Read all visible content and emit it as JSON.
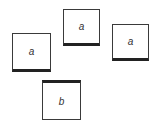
{
  "cards": [
    {
      "label": "a",
      "x": 12,
      "y": 33,
      "w": 39,
      "h": 39,
      "thick_edge": "bottom"
    },
    {
      "label": "a",
      "x": 63,
      "y": 9,
      "w": 37,
      "h": 37,
      "thick_edge": "bottom"
    },
    {
      "label": "a",
      "x": 112,
      "y": 24,
      "w": 37,
      "h": 37,
      "thick_edge": "bottom"
    },
    {
      "label": "b",
      "x": 42,
      "y": 80,
      "w": 39,
      "h": 40,
      "thick_edge": "top"
    }
  ]
}
